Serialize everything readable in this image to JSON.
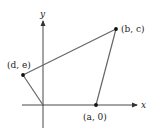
{
  "diagram": {
    "axes": {
      "x_label": "x",
      "y_label": "y",
      "origin": [
        43,
        105
      ]
    },
    "points": [
      {
        "id": "b-c",
        "label": "(b, c)",
        "pos": [
          116,
          29
        ]
      },
      {
        "id": "d-e",
        "label": "(d, e)",
        "pos": [
          23,
          75
        ]
      },
      {
        "id": "a-0",
        "label": "(a, 0)",
        "pos": [
          96,
          105
        ]
      }
    ],
    "polygon_order": [
      "origin",
      "a-0",
      "b-c",
      "d-e",
      "origin"
    ],
    "colors": {
      "lines": "#555555",
      "axes": "#333333",
      "points": "#111111",
      "text": "#222222"
    }
  }
}
